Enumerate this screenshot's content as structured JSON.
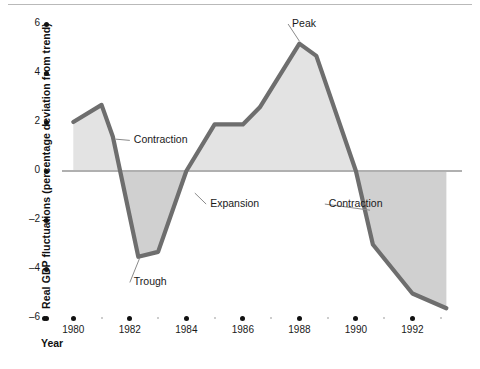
{
  "chart_data": {
    "type": "area",
    "title": "",
    "xlabel": "Year",
    "ylabel": "Real GDP fluctuations (percentage deviation from trend)",
    "xlim": [
      1979.6,
      1993.4
    ],
    "ylim": [
      -6,
      6
    ],
    "grid": false,
    "legend": "none",
    "zero_reference_line": 0,
    "x": [
      1980.0,
      1981.0,
      1981.4,
      1982.3,
      1983.0,
      1984.0,
      1985.0,
      1986.0,
      1986.6,
      1988.0,
      1988.6,
      1990.0,
      1990.6,
      1992.0,
      1993.2
    ],
    "values": [
      2.0,
      2.7,
      1.4,
      -3.5,
      -3.3,
      0.0,
      1.9,
      1.9,
      2.6,
      5.2,
      4.7,
      0.0,
      -3.0,
      -5.0,
      -5.6
    ],
    "series": [
      {
        "name": "Real GDP deviation from trend",
        "values": [
          2.0,
          2.7,
          1.4,
          -3.5,
          -3.3,
          0.0,
          1.9,
          1.9,
          2.6,
          5.2,
          4.7,
          0.0,
          -3.0,
          -5.0,
          -5.6
        ]
      }
    ],
    "y_ticks": [
      6,
      4,
      2,
      0,
      -2,
      -4,
      -6
    ],
    "y_tick_labels": [
      "6",
      "4",
      "2",
      "0",
      "-2",
      "-4",
      "-6"
    ],
    "x_ticks": [
      1980,
      1982,
      1984,
      1986,
      1988,
      1990,
      1992
    ],
    "x_tick_labels": [
      "1980",
      "1982",
      "1984",
      "1986",
      "1988",
      "1990",
      "1992"
    ],
    "x_minor_ticks": [
      1981,
      1983,
      1985,
      1987,
      1989,
      1991,
      1993
    ],
    "annotations": [
      {
        "label": "Contraction",
        "point_x": 1981.5,
        "point_y": 1.3,
        "text_x": 1982.0,
        "text_y": 1.25
      },
      {
        "label": "Trough",
        "point_x": 1982.35,
        "point_y": -3.55,
        "text_x": 1982.0,
        "text_y": -4.55
      },
      {
        "label": "Expansion",
        "point_x": 1984.3,
        "point_y": -0.9,
        "text_x": 1984.7,
        "text_y": -1.35
      },
      {
        "label": "Peak",
        "point_x": 1988.0,
        "point_y": 5.3,
        "text_x": 1987.6,
        "text_y": 6.0
      },
      {
        "label": "Contraction",
        "point_x": 1990.5,
        "point_y": -1.6,
        "text_x": 1988.9,
        "text_y": -1.35
      }
    ],
    "colors": {
      "line": "#6e6e6e",
      "area_positive": "#e3e3e3",
      "area_negative": "#d0d0d0",
      "zero_line": "#b0b0b0",
      "axis_text": "#1a1a1a",
      "background": "#ffffff"
    }
  }
}
